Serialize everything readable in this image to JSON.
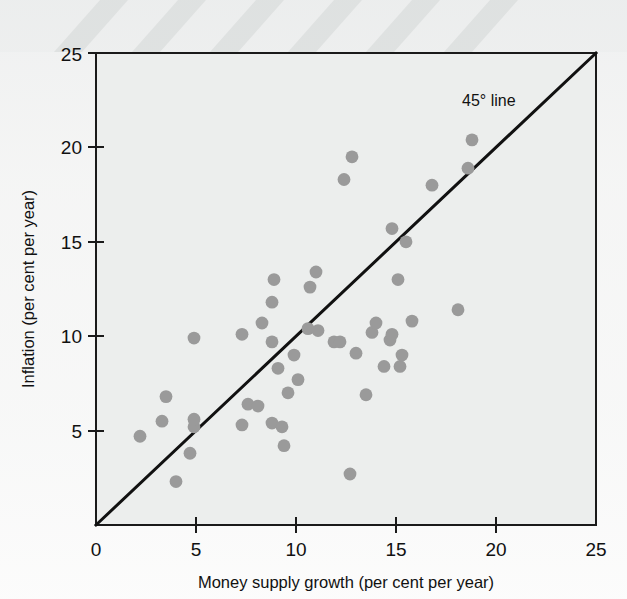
{
  "figure": {
    "background_color": "#eceeed",
    "plot_frame_color": "#1a1a1a",
    "point_color": "#9a9a9a",
    "line_color": "#111111"
  },
  "axes": {
    "x_title": "Money supply growth (per cent per year)",
    "y_title": "Inflation (per cent per year)",
    "x_ticks": [
      "0",
      "5",
      "10",
      "15",
      "20",
      "25"
    ],
    "y_ticks": [
      "5",
      "10",
      "15",
      "20",
      "25"
    ]
  },
  "annotations": {
    "diagonal_label": "45° line"
  },
  "chart_data": {
    "type": "scatter",
    "title": "",
    "xlabel": "Money supply growth (per cent per year)",
    "ylabel": "Inflation (per cent per year)",
    "xlim": [
      0,
      25
    ],
    "ylim": [
      0,
      25
    ],
    "xticks": [
      0,
      5,
      10,
      15,
      20,
      25
    ],
    "yticks": [
      0,
      5,
      10,
      15,
      20,
      25
    ],
    "grid": false,
    "legend": null,
    "reference_line": {
      "label": "45° line",
      "type": "identity",
      "from": [
        0,
        0
      ],
      "to": [
        25,
        25
      ]
    },
    "series": [
      {
        "name": "Countries",
        "marker": "circle",
        "color": "#9a9a9a",
        "points": [
          [
            2.2,
            4.7
          ],
          [
            3.3,
            5.5
          ],
          [
            3.5,
            6.8
          ],
          [
            4.0,
            2.3
          ],
          [
            4.7,
            3.8
          ],
          [
            4.9,
            5.2
          ],
          [
            4.9,
            5.6
          ],
          [
            4.9,
            9.9
          ],
          [
            7.3,
            5.3
          ],
          [
            7.3,
            10.1
          ],
          [
            7.6,
            6.4
          ],
          [
            8.1,
            6.3
          ],
          [
            8.3,
            10.7
          ],
          [
            8.8,
            5.4
          ],
          [
            8.8,
            9.7
          ],
          [
            8.8,
            11.8
          ],
          [
            8.9,
            13.0
          ],
          [
            9.1,
            8.3
          ],
          [
            9.3,
            5.2
          ],
          [
            9.4,
            4.2
          ],
          [
            9.6,
            7.0
          ],
          [
            9.9,
            9.0
          ],
          [
            10.1,
            7.7
          ],
          [
            10.6,
            10.4
          ],
          [
            10.7,
            12.6
          ],
          [
            11.0,
            13.4
          ],
          [
            11.1,
            10.3
          ],
          [
            11.9,
            9.7
          ],
          [
            12.2,
            9.7
          ],
          [
            12.4,
            18.3
          ],
          [
            12.7,
            2.7
          ],
          [
            12.8,
            19.5
          ],
          [
            13.0,
            9.1
          ],
          [
            13.5,
            6.9
          ],
          [
            13.8,
            10.2
          ],
          [
            14.0,
            10.7
          ],
          [
            14.4,
            8.4
          ],
          [
            14.7,
            9.8
          ],
          [
            14.8,
            10.1
          ],
          [
            14.8,
            15.7
          ],
          [
            15.1,
            13.0
          ],
          [
            15.2,
            8.4
          ],
          [
            15.3,
            9.0
          ],
          [
            15.5,
            15.0
          ],
          [
            15.8,
            10.8
          ],
          [
            16.8,
            18.0
          ],
          [
            18.1,
            11.4
          ],
          [
            18.6,
            18.9
          ],
          [
            18.8,
            20.4
          ]
        ]
      }
    ]
  }
}
